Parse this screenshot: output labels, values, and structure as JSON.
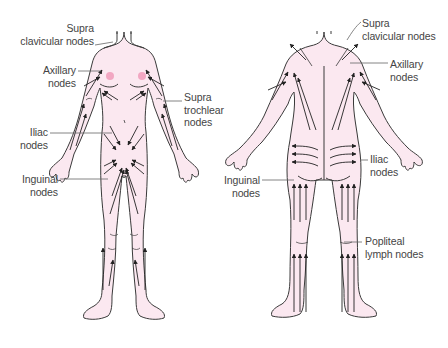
{
  "diagram": {
    "colors": {
      "skin": "#fbe8f0",
      "outline": "#3a3a3a",
      "arrow": "#222222",
      "nipple": "#f2a7c2",
      "leader": "#666666",
      "text": "#444444"
    },
    "front_view": {
      "labels": [
        {
          "id": "supraclavicular",
          "lines": [
            "Supra",
            "clavicular nodes"
          ]
        },
        {
          "id": "axillary",
          "lines": [
            "Axillary",
            "nodes"
          ]
        },
        {
          "id": "supratrochlear",
          "lines": [
            "Supra",
            "trochlear",
            "nodes"
          ]
        },
        {
          "id": "iliac",
          "lines": [
            "Iliac",
            "nodes"
          ]
        },
        {
          "id": "inguinal",
          "lines": [
            "Inguinal",
            "nodes"
          ]
        }
      ]
    },
    "back_view": {
      "labels": [
        {
          "id": "supraclavicular",
          "lines": [
            "Supra",
            "clavicular nodes"
          ]
        },
        {
          "id": "axillary",
          "lines": [
            "Axillary",
            "nodes"
          ]
        },
        {
          "id": "iliac",
          "lines": [
            "Iliac",
            "nodes"
          ]
        },
        {
          "id": "inguinal",
          "lines": [
            "Inguinal",
            "nodes"
          ]
        },
        {
          "id": "popliteal",
          "lines": [
            "Popliteal",
            "lymph nodes"
          ]
        }
      ]
    }
  }
}
